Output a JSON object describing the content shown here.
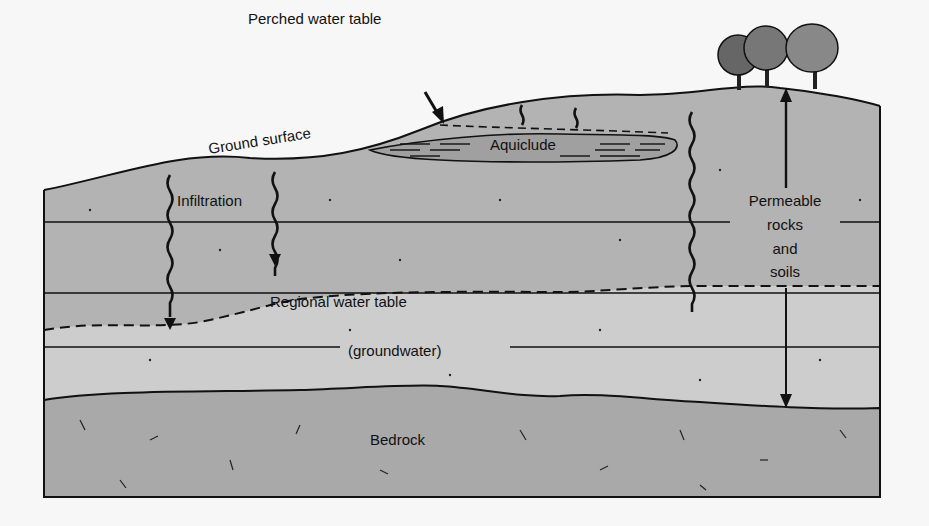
{
  "diagram": {
    "labels": {
      "perched_water_table": "Perched water table",
      "ground_surface": "Ground surface",
      "aquiclude": "Aquiclude",
      "infiltration": "Infiltration",
      "permeable_line1": "Permeable",
      "permeable_line2": "rocks",
      "permeable_line3": "and",
      "permeable_line4": "soils",
      "regional_water_table": "Regional water table",
      "groundwater": "(groundwater)",
      "bedrock": "Bedrock"
    },
    "colors": {
      "background": "#f7f7f7",
      "unsaturated_zone": "#b3b3b3",
      "saturated_zone": "#cdcdcd",
      "bedrock": "#a9a9a9",
      "aquiclude": "#a0a0a0",
      "line": "#111111"
    }
  }
}
